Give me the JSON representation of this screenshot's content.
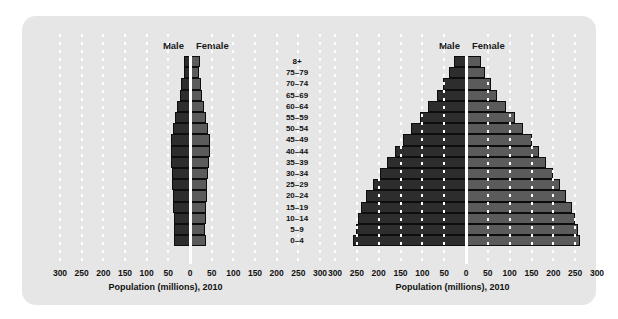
{
  "panel": {
    "background_color": "#e6e6e6",
    "gridline_color": "#ffffff"
  },
  "colors": {
    "male_bar": "#2d2d2d",
    "female_bar": "#5b5b5b",
    "axis_line": "#ffffff",
    "text": "#111111"
  },
  "legend": {
    "male_label": "Male",
    "female_label": "Female"
  },
  "age_groups": [
    "8+",
    "75–79",
    "70–74",
    "65–69",
    "60–64",
    "55–59",
    "50–54",
    "45–49",
    "40–44",
    "35–39",
    "30–34",
    "25–29",
    "20–24",
    "15–19",
    "10–14",
    "5–9",
    "0–4"
  ],
  "axis": {
    "ticks": [
      300,
      250,
      200,
      150,
      100,
      50,
      0,
      50,
      100,
      150,
      200,
      250,
      300
    ],
    "title": "Population (millions), 2010",
    "max": 300
  },
  "chart_data": [
    {
      "type": "bar",
      "id": "developed-countries-pyramid",
      "title": "",
      "orientation": "horizontal-diverging",
      "xlabel": "Population (millions), 2010",
      "ylabel": "",
      "xlim": [
        -300,
        300
      ],
      "grid": true,
      "legend_position": "top",
      "categories": [
        "8+",
        "75–79",
        "70–74",
        "65–69",
        "60–64",
        "55–59",
        "50–54",
        "45–49",
        "40–44",
        "35–39",
        "30–34",
        "25–29",
        "20–24",
        "15–19",
        "10–14",
        "5–9",
        "0–4"
      ],
      "series": [
        {
          "name": "Male",
          "values": [
            13,
            15,
            20,
            24,
            29,
            34,
            40,
            44,
            45,
            44,
            42,
            41,
            40,
            39,
            38,
            37,
            38
          ]
        },
        {
          "name": "Female",
          "values": [
            22,
            20,
            25,
            28,
            32,
            37,
            42,
            45,
            46,
            44,
            42,
            40,
            39,
            37,
            36,
            35,
            36
          ]
        }
      ]
    },
    {
      "type": "bar",
      "id": "developing-countries-pyramid",
      "title": "",
      "orientation": "horizontal-diverging",
      "xlabel": "Population (millions), 2010",
      "ylabel": "",
      "xlim": [
        -300,
        300
      ],
      "grid": true,
      "legend_position": "top",
      "categories": [
        "8+",
        "75–79",
        "70–74",
        "65–69",
        "60–64",
        "55–59",
        "50–54",
        "45–49",
        "40–44",
        "35–39",
        "30–34",
        "25–29",
        "20–24",
        "15–19",
        "10–14",
        "5–9",
        "0–4"
      ],
      "series": [
        {
          "name": "Male",
          "values": [
            28,
            38,
            52,
            66,
            86,
            106,
            125,
            145,
            163,
            180,
            196,
            212,
            228,
            240,
            248,
            252,
            258
          ]
        },
        {
          "name": "Female",
          "values": [
            35,
            44,
            58,
            72,
            92,
            112,
            130,
            150,
            167,
            184,
            200,
            216,
            230,
            242,
            250,
            256,
            262
          ]
        }
      ]
    }
  ]
}
